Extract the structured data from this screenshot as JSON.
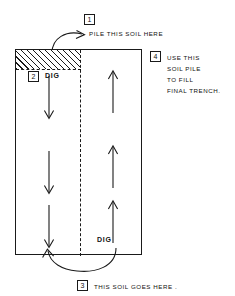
{
  "diagram": {
    "background_color": "#ffffff",
    "line_color": "#1a1a1a"
  },
  "steps": {
    "one": {
      "badge": "1",
      "text": "PILE  THIS  SOIL HERE"
    },
    "two": {
      "badge": "2",
      "label": "DIG"
    },
    "three": {
      "badge": "3",
      "text": "THIS SOIL GOES HERE ."
    },
    "four": {
      "badge": "4",
      "line1": "USE THIS",
      "line2": "SOIL PILE",
      "line3": "TO FILL",
      "line4": "FINAL TRENCH."
    }
  },
  "trench": {
    "right_column_label": "DIG",
    "hatch_region_name": "soil-pile-hatched-area",
    "left_column_direction": "down",
    "right_column_direction": "up",
    "left_arrow_count": 3,
    "right_arrow_count": 3
  }
}
